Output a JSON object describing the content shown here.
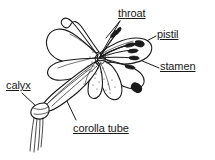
{
  "figure": {
    "kind": "botanical-line-drawing",
    "background_color": "#ffffff",
    "ink_color": "#1a1a1a"
  },
  "labels": {
    "throat": "throat",
    "pistil": "pistil",
    "stamen": "stamen",
    "calyx": "calyx",
    "corolla_tube": "corolla tube"
  },
  "parts": [
    {
      "id": "throat",
      "label": "throat",
      "leader": "from label down-left into the flower center opening"
    },
    {
      "id": "pistil",
      "label": "pistil",
      "leader": "from label left to the long central style with stigma"
    },
    {
      "id": "stamen",
      "label": "stamen",
      "leader": "from label left to a filament tipped with an anther"
    },
    {
      "id": "calyx",
      "label": "calyx",
      "leader": "from label down-right to the small green cup at the tube base"
    },
    {
      "id": "corolla_tube",
      "label": "corolla tube",
      "leader": "from label up-left to the long fused petal tube"
    }
  ],
  "icons": {
    "flower": "lily-flower-icon"
  }
}
